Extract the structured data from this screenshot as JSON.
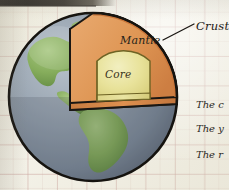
{
  "page": {
    "background_color": "#f3f1e7",
    "grid_line_color": "#c49692"
  },
  "diagram": {
    "name": "earth-cutaway-diagram",
    "globe": {
      "ocean_color": "#8b97a6",
      "land_color": "#7fa85a",
      "outline_color": "#15130f",
      "center_x": 93,
      "center_y": 97,
      "radius": 84
    },
    "layers": [
      {
        "id": "crust",
        "label": "Crust",
        "color": "#c9763a"
      },
      {
        "id": "mantle",
        "label": "Mantle",
        "color": "#dd9050"
      },
      {
        "id": "core",
        "label": "Core",
        "color": "#e8e29a"
      }
    ],
    "callout": {
      "label": "Crust",
      "leader_line_color": "#1a1713"
    }
  },
  "captions": {
    "lines": [
      "The c",
      "The y",
      "The r"
    ]
  }
}
